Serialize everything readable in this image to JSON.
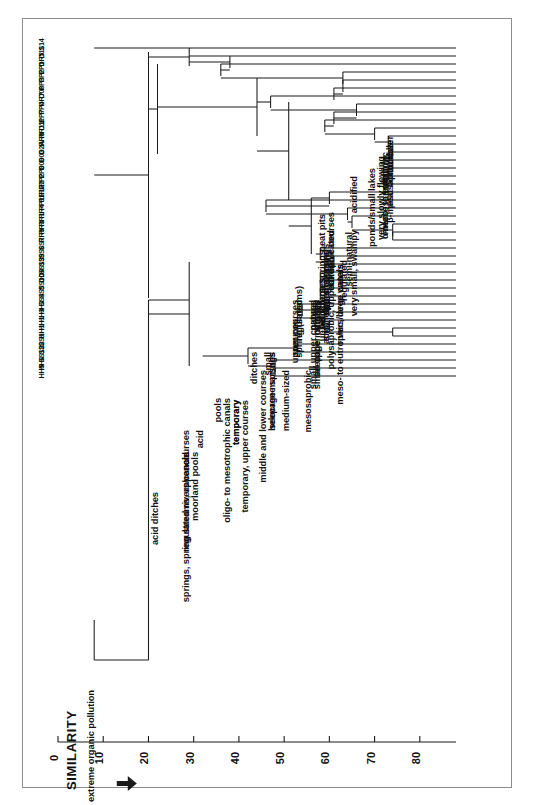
{
  "figure": {
    "title": "",
    "orientation": "rotated-90",
    "background": "#ffffff",
    "frame_color": "#8d8d8d",
    "line_color": "#1a1a1a"
  },
  "axis": {
    "label": "SIMILARITY",
    "arrow": "arrow-right",
    "ticks": [
      "0",
      "10",
      "20",
      "30",
      "40",
      "50",
      "60",
      "70",
      "80"
    ],
    "tick_values": [
      0,
      10,
      20,
      30,
      40,
      50,
      60,
      70,
      80
    ],
    "min": 0,
    "max": 88
  },
  "chart_data": {
    "type": "dendrogram",
    "title": "",
    "xlabel": "SIMILARITY",
    "ylabel": "",
    "xlim": [
      0,
      88
    ],
    "grid": false,
    "legend": "none",
    "orientation": "horizontal-rotated",
    "leaf_labels": [
      "S14",
      "D11",
      "DR5",
      "PP1",
      "PP2",
      "PP3",
      "D06",
      "DR7",
      "PP4",
      "PP7",
      "D11b",
      "RR11",
      "RR8",
      "D2A",
      "D03",
      "D06b",
      "PP8",
      "PP2b",
      "RR2",
      "RR12",
      "PP11",
      "RR4",
      "RR1",
      "RR3",
      "RR9",
      "SS7",
      "SS6",
      "SS9",
      "SS13",
      "DD8",
      "SS10",
      "SS5",
      "SS4",
      "HH3",
      "HH3b",
      "HH1",
      "HH1b",
      "SS1",
      "SS2",
      "SS12",
      "HH6",
      "HH5"
    ],
    "leaf_count": 42,
    "clusters": [
      {
        "label": "extreme organic pollution",
        "similarity": 8
      },
      {
        "label": "acidified",
        "similarity": 66
      },
      {
        "label": "regulated rivers/canals",
        "similarity": 29
      },
      {
        "label": "acid",
        "similarity": 29
      },
      {
        "label": "moorland pools",
        "similarity": 31
      },
      {
        "label": "temporary",
        "similarity": 40
      },
      {
        "label": "acid ditches",
        "similarity": 22
      },
      {
        "label": "oligo- to mesotrophic canals",
        "similarity": 38
      },
      {
        "label": "pools",
        "similarity": 36
      },
      {
        "label": "meso- to eutrophic, deep waters",
        "similarity": 63
      },
      {
        "label": "rivers/large canals",
        "similarity": 63
      },
      {
        "label": "lakes",
        "similarity": 61
      },
      {
        "label": "small",
        "similarity": 47
      },
      {
        "label": "very small, swampy",
        "similarity": 66
      },
      {
        "label": "ditches",
        "similarity": 44
      },
      {
        "label": "eutrophicated",
        "similarity": 61
      },
      {
        "label": "peat pits",
        "similarity": 59
      },
      {
        "label": "ponds/small lakes",
        "similarity": 70
      },
      {
        "label": "shallow",
        "similarity": 73
      },
      {
        "label": "peat bottom",
        "similarity": 74
      },
      {
        "label": "meso- to eutrophic",
        "similarity": 73
      },
      {
        "label": "β-mesosaprobic",
        "similarity": 74
      },
      {
        "label": "α-mesosaprobic",
        "similarity": 73
      },
      {
        "label": "very slowly flowing",
        "similarity": 72
      },
      {
        "label": "medium-sized",
        "similarity": 51
      },
      {
        "label": "mesosaprobic",
        "similarity": 56
      },
      {
        "label": "small rivers",
        "similarity": 60
      },
      {
        "label": "middle and lower courses",
        "similarity": 46
      },
      {
        "label": "regulated",
        "similarity": 64
      },
      {
        "label": "semi-natural",
        "similarity": 65
      },
      {
        "label": "lower",
        "similarity": 74
      },
      {
        "label": "middle",
        "similarity": 74
      },
      {
        "label": "temporary",
        "similarity": 40
      },
      {
        "label": "summer",
        "similarity": 53
      },
      {
        "label": "upper courses",
        "similarity": 60
      },
      {
        "label": "small upper courses",
        "similarity": 57
      },
      {
        "label": "ditch",
        "similarity": 59
      },
      {
        "label": "regulated",
        "similarity": 54
      },
      {
        "label": "stream",
        "similarity": 58
      },
      {
        "label": "natural",
        "similarity": 57
      },
      {
        "label": "polysaprobic, upper/middle courses",
        "similarity": 61
      },
      {
        "label": "upper courses",
        "similarity": 59
      },
      {
        "label": "small upper courses",
        "similarity": 58
      },
      {
        "label": "seepage marshes",
        "similarity": 58
      },
      {
        "label": "slightly",
        "similarity": 58
      },
      {
        "label": "acid helocrene springs",
        "similarity": 60
      },
      {
        "label": "spring (streams)",
        "similarity": 54
      },
      {
        "label": "helocrene springs",
        "similarity": 59
      },
      {
        "label": "spring streams",
        "similarity": 60
      },
      {
        "label": "upper courses",
        "similarity": 53
      },
      {
        "label": "springs, spring streams, upper courses",
        "similarity": 29
      },
      {
        "label": "acid",
        "similarity": 32
      },
      {
        "label": "temporary, upper courses",
        "similarity": 42
      },
      {
        "label": "seepage marshes",
        "similarity": 48
      },
      {
        "label": "helocrene springs",
        "similarity": 48
      }
    ],
    "root_similarity": 8,
    "major_split_similarity": 20
  },
  "leaves": [
    {
      "id": "S14",
      "x": 62
    },
    {
      "id": "D11",
      "x": 70
    },
    {
      "id": "DR5",
      "x": 78
    },
    {
      "id": "PP1",
      "x": 86
    },
    {
      "id": "PP2",
      "x": 94
    },
    {
      "id": "PP3",
      "x": 102
    },
    {
      "id": "D06",
      "x": 110
    },
    {
      "id": "DR7",
      "x": 118
    },
    {
      "id": "PP4",
      "x": 126
    },
    {
      "id": "PP7",
      "x": 134
    },
    {
      "id": "D11b",
      "x": 142
    },
    {
      "id": "RR11",
      "x": 150
    },
    {
      "id": "RR8",
      "x": 158
    },
    {
      "id": "D2A",
      "x": 166
    },
    {
      "id": "D03",
      "x": 174
    },
    {
      "id": "D06b",
      "x": 182
    },
    {
      "id": "PP8",
      "x": 190
    },
    {
      "id": "PP2b",
      "x": 198
    },
    {
      "id": "RR2",
      "x": 206
    },
    {
      "id": "RR12",
      "x": 214
    },
    {
      "id": "PP11",
      "x": 222
    },
    {
      "id": "RR4",
      "x": 230
    },
    {
      "id": "RR1",
      "x": 238
    },
    {
      "id": "RR3",
      "x": 246
    },
    {
      "id": "RR9",
      "x": 254
    },
    {
      "id": "SS7",
      "x": 262
    },
    {
      "id": "SS6",
      "x": 270
    },
    {
      "id": "SS9",
      "x": 278
    },
    {
      "id": "SS13",
      "x": 286
    },
    {
      "id": "DD8",
      "x": 294
    },
    {
      "id": "SS10",
      "x": 302
    },
    {
      "id": "SS5",
      "x": 310
    },
    {
      "id": "SS4",
      "x": 318
    },
    {
      "id": "HH3",
      "x": 326
    },
    {
      "id": "HH3b",
      "x": 334
    },
    {
      "id": "HH1",
      "x": 342
    },
    {
      "id": "HH1b",
      "x": 350
    },
    {
      "id": "SS1",
      "x": 358
    },
    {
      "id": "SS2",
      "x": 366
    },
    {
      "id": "SS12",
      "x": 374
    },
    {
      "id": "HH6",
      "x": 382
    },
    {
      "id": "HH5",
      "x": 394
    }
  ]
}
